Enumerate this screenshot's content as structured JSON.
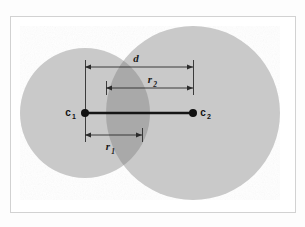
{
  "figure": {
    "background_color": "#fdfdfd",
    "frame": {
      "border_color": "#d2d2d2",
      "fill_color": "#ffffff",
      "x": 10,
      "y": 16,
      "width": 285,
      "height": 196
    },
    "colors": {
      "circle_fill": "#c9c9c9",
      "circle_overlap_fill": "#a9a9a9",
      "line_color": "#1a1a1a",
      "dimension_line_color": "#2b2b2b",
      "label_color": "#111111"
    },
    "circles": [
      {
        "id": "circle-1",
        "name": "small-circle",
        "center_label": "c",
        "center_subscript": "1",
        "radius_label": "r",
        "radius_subscript": "1",
        "cx": 85,
        "cy": 113,
        "r": 65,
        "fill": "#c9c9c9"
      },
      {
        "id": "circle-2",
        "name": "large-circle",
        "center_label": "c",
        "center_subscript": "2",
        "radius_label": "r",
        "radius_subscript": "2",
        "cx": 193,
        "cy": 113,
        "r": 87,
        "fill": "#c9c9c9"
      }
    ],
    "centers": [
      {
        "id": "center-point-1",
        "label": "c",
        "subscript": "1",
        "x": 85,
        "y": 113,
        "label_x": 70,
        "label_y": 116,
        "dot_radius": 4
      },
      {
        "id": "center-point-2",
        "label": "c",
        "subscript": "2",
        "x": 193,
        "y": 113,
        "label_x": 201,
        "label_y": 116,
        "dot_radius": 4
      }
    ],
    "connector": {
      "id": "center-distance-line",
      "x1": 85,
      "y1": 113,
      "x2": 193,
      "y2": 113
    },
    "dimensions": [
      {
        "id": "dimension-d",
        "name": "distance-between-centers",
        "label": "d",
        "subscript": "",
        "x1": 85,
        "x2": 193,
        "y": 67,
        "label_x": 136,
        "label_y": 62,
        "tick_top": 60,
        "tick_bottom": 74
      },
      {
        "id": "dimension-r2",
        "name": "radius-of-large-circle",
        "label": "r",
        "subscript": "2",
        "x1": 106,
        "x2": 193,
        "y": 88,
        "label_x": 153,
        "label_y": 83,
        "tick_top": 81,
        "tick_bottom": 95
      },
      {
        "id": "dimension-r1",
        "name": "radius-of-small-circle",
        "label": "r",
        "subscript": "1",
        "x1": 85,
        "x2": 142,
        "y": 135,
        "label_x": 110,
        "label_y": 150,
        "tick_top": 128,
        "tick_bottom": 142
      }
    ],
    "guide_lines": [
      {
        "id": "guide-c1-vertical",
        "x": 85,
        "y1": 60,
        "y2": 142
      },
      {
        "id": "guide-c2-vertical",
        "x": 193,
        "y1": 60,
        "y2": 95
      },
      {
        "id": "guide-lens-left-vertical",
        "x": 106,
        "y1": 81,
        "y2": 95
      },
      {
        "id": "guide-lens-right-vertical",
        "x": 142,
        "y1": 128,
        "y2": 142
      }
    ]
  }
}
